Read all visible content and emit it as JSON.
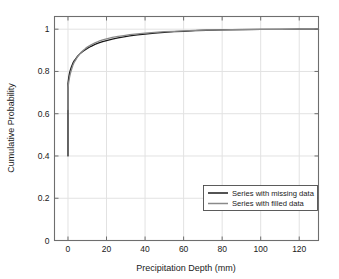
{
  "chart_data": {
    "type": "line",
    "title": "",
    "xlabel": "Precipitation Depth (mm)",
    "ylabel": "Cumulative Probability",
    "xlim": [
      -7,
      130
    ],
    "ylim": [
      0,
      1.06
    ],
    "xticks": [
      0,
      20,
      40,
      60,
      80,
      100,
      120
    ],
    "xticklabels": [
      "0",
      "20",
      "40",
      "60",
      "80",
      "100",
      "120"
    ],
    "yticks": [
      0,
      0.2,
      0.4,
      0.6,
      0.8,
      1
    ],
    "yticklabels": [
      "0",
      "0.2",
      "0.4",
      "0.6",
      "0.8",
      "1"
    ],
    "grid": true,
    "legend_position": "lower right",
    "series": [
      {
        "name": "Series with missing data",
        "color": "#1a1a1a",
        "x": [
          0,
          0,
          0.4,
          0.8,
          1.2,
          1.8,
          2.5,
          3.2,
          4,
          5,
          6,
          7,
          8,
          9,
          10,
          12,
          14,
          16,
          18,
          20,
          23,
          26,
          29,
          32,
          36,
          40,
          45,
          50,
          55,
          60,
          66,
          72,
          80,
          90,
          100,
          110,
          120,
          130
        ],
        "y": [
          0.4,
          0.742,
          0.772,
          0.792,
          0.806,
          0.822,
          0.838,
          0.85,
          0.86,
          0.872,
          0.882,
          0.89,
          0.897,
          0.903,
          0.909,
          0.919,
          0.928,
          0.935,
          0.941,
          0.946,
          0.953,
          0.959,
          0.964,
          0.968,
          0.973,
          0.977,
          0.981,
          0.985,
          0.988,
          0.99,
          0.993,
          0.995,
          0.997,
          0.998,
          0.999,
          0.9995,
          0.9998,
          1.0
        ]
      },
      {
        "name": "Series with filled data",
        "color": "#8a8a8a",
        "x": [
          0,
          0,
          0.4,
          0.8,
          1.2,
          1.8,
          2.5,
          3.2,
          4,
          5,
          6,
          7,
          8,
          9,
          10,
          12,
          14,
          16,
          18,
          20,
          23,
          26,
          29,
          32,
          36,
          40,
          45,
          50,
          55,
          60,
          66,
          72,
          80,
          90,
          100,
          110,
          120,
          130
        ],
        "y": [
          0.62,
          0.722,
          0.75,
          0.772,
          0.789,
          0.808,
          0.828,
          0.843,
          0.855,
          0.87,
          0.882,
          0.892,
          0.9,
          0.908,
          0.915,
          0.926,
          0.935,
          0.943,
          0.949,
          0.954,
          0.961,
          0.966,
          0.97,
          0.974,
          0.978,
          0.981,
          0.985,
          0.988,
          0.99,
          0.992,
          0.994,
          0.996,
          0.997,
          0.9985,
          0.9993,
          0.9997,
          0.9999,
          1.0
        ]
      }
    ]
  },
  "legend": {
    "entries": [
      {
        "label": "Series with missing data"
      },
      {
        "label": "Series with filled data"
      }
    ]
  },
  "axes": {
    "x_title": "Precipitation Depth (mm)",
    "y_title": "Cumulative Probability"
  },
  "colors": {
    "series_missing": "#1a1a1a",
    "series_filled": "#8a8a8a",
    "axis": "#6e6e6e",
    "grid": "#e2e2e2",
    "background": "#ffffff"
  }
}
